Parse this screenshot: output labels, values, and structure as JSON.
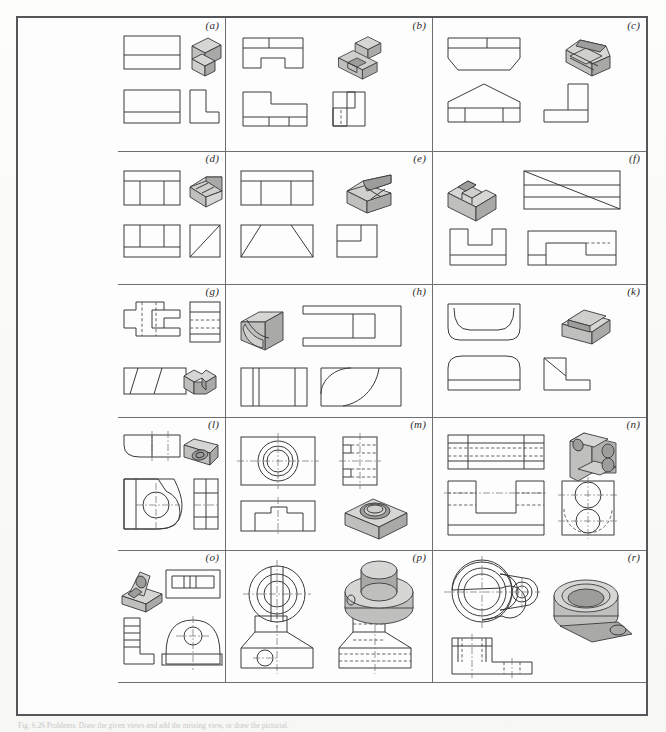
{
  "plate": {
    "title": "Missing-view / pictorial drawing problems plate",
    "caption": "Fig. 6.26 Problems. Draw the given views and add the missing view, or draw the pictorial.",
    "rows": 5,
    "columns": 3,
    "label_style": "italic-parenthesized-lowercase",
    "border_color": "#55565a",
    "line_color": "#3a3a3c",
    "hidden_line_color": "#55565a",
    "center_line_color": "#6b6c70",
    "shade_colors": [
      "#d6d6d4",
      "#bfbfbd",
      "#a9a9a7"
    ],
    "paper_color": "#fdfdfd"
  },
  "cells": [
    {
      "label": "(a)",
      "name": "problem-a",
      "pictorial_position": "top-right",
      "views": [
        "top",
        "front",
        "side"
      ],
      "description": "L-shaped block, two rectangular orthographic views and an L profile side view"
    },
    {
      "label": "(b)",
      "name": "problem-b",
      "pictorial_position": "top-right",
      "views": [
        "top",
        "front",
        "side"
      ],
      "description": "Notched U-shaped base with raised rib, stepped side view with hidden line"
    },
    {
      "label": "(c)",
      "name": "problem-c",
      "pictorial_position": "top-right",
      "views": [
        "top",
        "front",
        "side"
      ],
      "description": "Chamfered prism with gable front view and stepped right-side view"
    },
    {
      "label": "(d)",
      "name": "problem-d",
      "pictorial_position": "top-right",
      "views": [
        "top",
        "front",
        "side"
      ],
      "description": "Inclined wedge with rectangular slot, diagonal in side view"
    },
    {
      "label": "(e)",
      "name": "problem-e",
      "pictorial_position": "top-right",
      "views": [
        "top",
        "front",
        "side"
      ],
      "description": "Double-bevelled block, trapezoid front view, notched side view"
    },
    {
      "label": "(f)",
      "name": "problem-f",
      "pictorial_position": "top-left",
      "views": [
        "top",
        "front",
        "side"
      ],
      "description": "U-slotted block with inclined surface shown as diagonal in top view"
    },
    {
      "label": "(g)",
      "name": "problem-g",
      "pictorial_position": "bottom-right",
      "views": [
        "top",
        "front",
        "side"
      ],
      "description": "Cross-shaped plate with hidden slots and inclined dovetail faces"
    },
    {
      "label": "(h)",
      "name": "problem-h",
      "pictorial_position": "top-left",
      "views": [
        "top",
        "front",
        "side"
      ],
      "description": "Forked bracket with large cylindrical cut, quarter-round arc in side view"
    },
    {
      "label": "(k)",
      "name": "problem-k",
      "pictorial_position": "top-right",
      "views": [
        "top",
        "front",
        "side"
      ],
      "description": "Rounded-end saddle block, radiused top view and L-shaped side view"
    },
    {
      "label": "(l)",
      "name": "problem-l",
      "pictorial_position": "top-right",
      "views": [
        "top",
        "front",
        "side"
      ],
      "description": "Rounded-end bearing plate with a through hole and filleted corner"
    },
    {
      "label": "(m)",
      "name": "problem-m",
      "pictorial_position": "bottom-right",
      "views": [
        "top",
        "front",
        "side"
      ],
      "description": "Rectangular pad with counterbored circular recess, concentric circles in top view"
    },
    {
      "label": "(n)",
      "name": "problem-n",
      "pictorial_position": "top-right",
      "views": [
        "top",
        "front",
        "side"
      ],
      "description": "U-shaped yoke with two coaxial holes, many hidden lines"
    },
    {
      "label": "(o)",
      "name": "problem-o",
      "pictorial_position": "top-left",
      "views": [
        "top",
        "front",
        "side"
      ],
      "description": "Rib-supported bracket with drilled boss, arched front view"
    },
    {
      "label": "(p)",
      "name": "problem-p",
      "pictorial_position": "top-right",
      "views": [
        "top",
        "front",
        "side"
      ],
      "description": "Stepped cylindrical boss on tapered base with cross-drilled hole"
    },
    {
      "label": "(r)",
      "name": "problem-r",
      "pictorial_position": "right",
      "views": [
        "top",
        "front"
      ],
      "description": "Bearing housing with counterbored bore and lugged foot with small hole"
    }
  ]
}
